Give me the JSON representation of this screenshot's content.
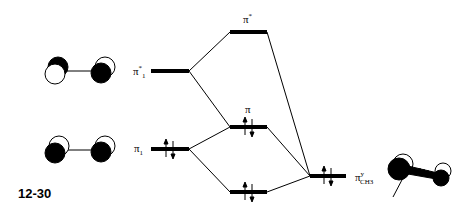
{
  "figure_label": "12-30",
  "levels": {
    "pi1_star": {
      "label": "π",
      "sup": "*",
      "sub": "1",
      "electrons": 0
    },
    "pi1": {
      "label": "π",
      "sub": "1",
      "electrons": 2
    },
    "pi_star": {
      "label": "π",
      "sup": "*",
      "electrons": 0
    },
    "pi": {
      "label": "π",
      "electrons": 2
    },
    "low": {
      "label": "",
      "electrons": 2
    },
    "pi_ch3": {
      "label": "π",
      "sup": "y",
      "sub": "CH3",
      "electrons": 2
    }
  },
  "orbital_pictures": [
    {
      "name": "pi1-star-orbital",
      "description": "two p orbitals, opposite phase"
    },
    {
      "name": "pi1-orbital",
      "description": "two p orbitals, same phase"
    },
    {
      "name": "pi-ch3-orbital",
      "description": "CH3 group pseudo-pi orbital"
    }
  ],
  "colors": {
    "line": "#000000",
    "fill": "#000000",
    "background": "#ffffff"
  }
}
